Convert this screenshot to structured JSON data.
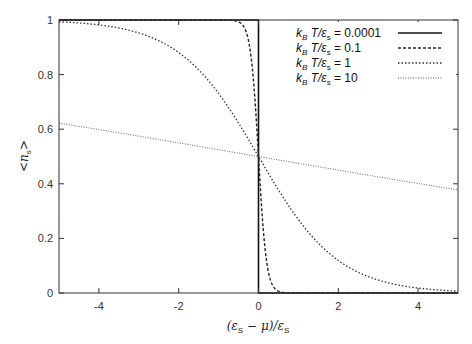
{
  "chart_data": {
    "type": "line",
    "title": "",
    "xlabel": "(ε_s − μ)/ε_s",
    "ylabel": "<n_s>",
    "xlim": [
      -5,
      5
    ],
    "ylim": [
      0,
      1
    ],
    "grid": false,
    "legend_position": "top-right",
    "x_ticks": [
      "-4",
      "-2",
      "0",
      "2",
      "4"
    ],
    "y_ticks": [
      "0",
      "0.2",
      "0.4",
      "0.6",
      "0.8",
      "1"
    ],
    "function": "Fermi-Dirac: <n_s> = 1/(exp((ε_s-μ)/(k_B T))+1)",
    "series": [
      {
        "name": "k_B T/ε_s = 0.0001",
        "kT": 0.0001,
        "style": "solid",
        "x": [
          -5,
          -0.01,
          0,
          0.01,
          5
        ],
        "values": [
          1,
          1,
          0.5,
          0,
          0
        ]
      },
      {
        "name": "k_B T/ε_s = 0.1",
        "kT": 0.1,
        "style": "dashed",
        "x": [
          -5,
          -0.5,
          -0.2,
          0,
          0.2,
          0.5,
          5
        ],
        "values": [
          1,
          0.993,
          0.881,
          0.5,
          0.119,
          0.007,
          0
        ]
      },
      {
        "name": "k_B T/ε_s = 1",
        "kT": 1,
        "style": "dotted",
        "x": [
          -5,
          -4,
          -2,
          -1,
          0,
          1,
          2,
          4,
          5
        ],
        "values": [
          0.993,
          0.982,
          0.881,
          0.731,
          0.5,
          0.269,
          0.119,
          0.018,
          0.007
        ]
      },
      {
        "name": "k_B T/ε_s = 10",
        "kT": 10,
        "style": "fine-dotted",
        "x": [
          -5,
          0,
          5
        ],
        "values": [
          0.622,
          0.5,
          0.378
        ]
      }
    ]
  },
  "legend": [
    {
      "prefix": "k",
      "sub": "B",
      "mid": " T/ε",
      "sub2": "s",
      "value": " = 0.0001"
    },
    {
      "prefix": "k",
      "sub": "B",
      "mid": " T/ε",
      "sub2": "s",
      "value": " = 0.1"
    },
    {
      "prefix": "k",
      "sub": "B",
      "mid": " T/ε",
      "sub2": "s",
      "value": " =   1"
    },
    {
      "prefix": "k",
      "sub": "B",
      "mid": " T/ε",
      "sub2": "s",
      "value": " = 10"
    }
  ],
  "axes": {
    "x_ticks": [
      "-4",
      "-2",
      "0",
      "2",
      "4"
    ],
    "y_ticks": [
      "0",
      "0.2",
      "0.4",
      "0.6",
      "0.8",
      "1"
    ],
    "xlabel_parts": {
      "open": "(ε",
      "sub1": "S",
      "mid": " − μ)/ε",
      "sub2": "S"
    },
    "ylabel_parts": {
      "open": "<n",
      "sub": "s",
      "close": ">"
    }
  }
}
